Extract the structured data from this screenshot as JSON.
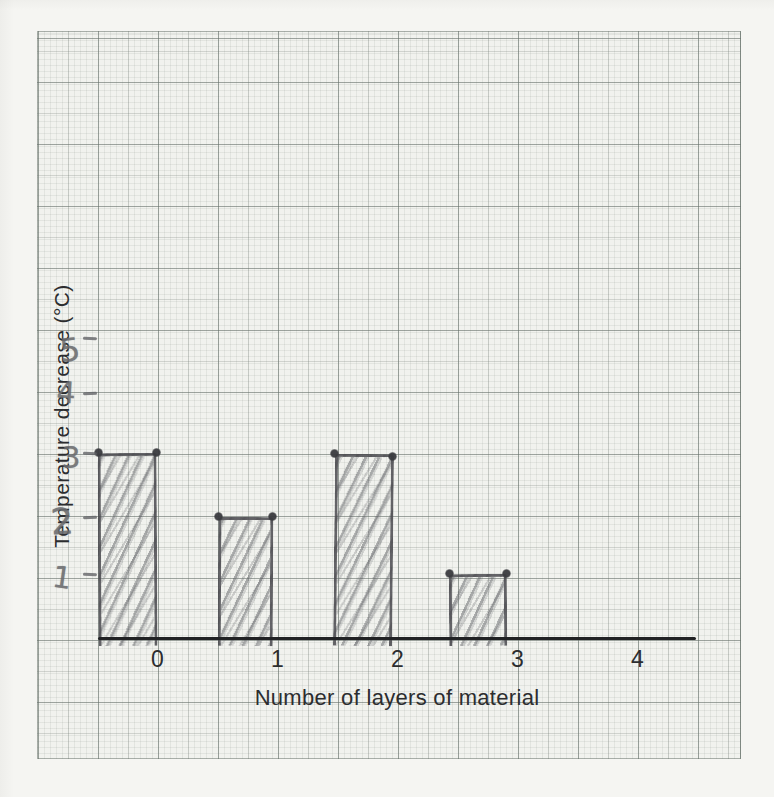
{
  "colors": {
    "paper": "#f1f2ee",
    "page_margin": "#f5f5f2",
    "grid_bold": "#9fa8a2",
    "pencil": "#6a6b6e",
    "ink": "#2c2d2f"
  },
  "chart_data": {
    "type": "bar",
    "title": "",
    "xlabel": "Number of layers of material",
    "ylabel": "Temperature decrease (°C)",
    "categories": [
      0,
      1,
      2,
      3
    ],
    "values": [
      3,
      2,
      3,
      1
    ],
    "x_tick_labels": [
      "0",
      "1",
      "2",
      "3",
      "4"
    ],
    "y_tick_labels": [
      "1",
      "2",
      "3",
      "4",
      "5"
    ],
    "xlim": [
      -0.5,
      4.5
    ],
    "ylim": [
      0,
      10
    ],
    "bar_width": 0.5,
    "bar_alignment": "each bar spans from category-0.5 to category",
    "grid": "printed graph paper: fine 1 mm, medium 5 mm, bold 10 mm lines",
    "legend": "none",
    "style": "hand-drawn pencil bars with diagonal hatching; pencil dots mark the top corners of each bar; y-axis tick numbers and dashes are handwritten in pencil; axis titles and x-axis numbers are printed"
  }
}
